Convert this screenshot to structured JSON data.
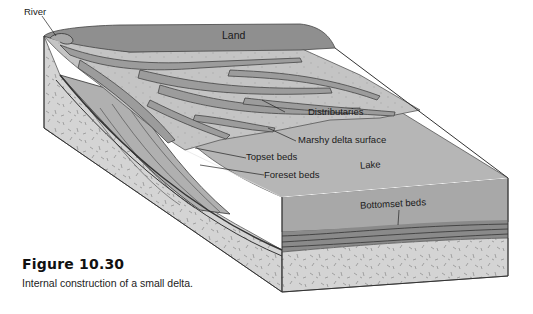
{
  "figure": {
    "number": "Figure 10.30",
    "caption": "Internal construction of a small delta."
  },
  "labels": {
    "river": "River",
    "land": "Land",
    "distributaries": "Distributaries",
    "marshy": "Marshy delta surface",
    "topset": "Topset beds",
    "foreset": "Foreset beds",
    "lake": "Lake",
    "bottomset": "Bottomset beds"
  },
  "colors": {
    "land": "#8f8f8f",
    "marsh": "#bcbcbc",
    "channel": "#9a9a9a",
    "lake_top": "#b3b3b3",
    "lake_front": "#a3a3a3",
    "rock": "#d2d2d2",
    "beds": "#7a7a7a"
  }
}
